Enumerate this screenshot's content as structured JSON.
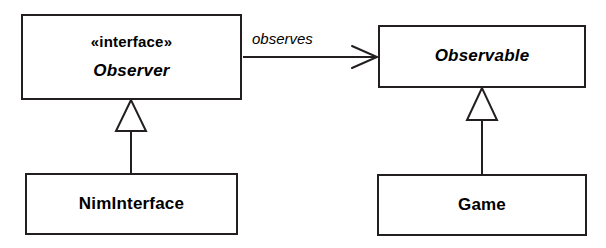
{
  "diagram": {
    "kind": "uml-class-diagram",
    "pattern": "Observer",
    "background_color": "#ffffff",
    "line_color": "#231f20",
    "classes": [
      {
        "id": "observer",
        "stereotype": "«interface»",
        "name": "Observer",
        "abstract": true
      },
      {
        "id": "observable",
        "stereotype": "",
        "name": "Observable",
        "abstract": true
      },
      {
        "id": "niminterface",
        "stereotype": "",
        "name": "NimInterface",
        "abstract": false
      },
      {
        "id": "game",
        "stereotype": "",
        "name": "Game",
        "abstract": false
      }
    ],
    "relationships": [
      {
        "id": "observes",
        "type": "association",
        "label": "observes",
        "source": "Observer",
        "target": "Observable",
        "arrowhead": "open"
      },
      {
        "id": "niminterface-implements-observer",
        "type": "generalization",
        "label": "",
        "source": "NimInterface",
        "target": "Observer",
        "arrowhead": "hollow-triangle"
      },
      {
        "id": "game-extends-observable",
        "type": "generalization",
        "label": "",
        "source": "Game",
        "target": "Observable",
        "arrowhead": "hollow-triangle"
      }
    ]
  }
}
